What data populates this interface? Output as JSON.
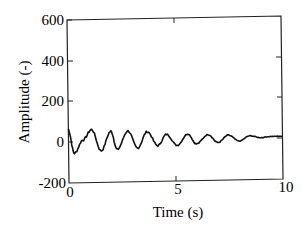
{
  "chart_data": {
    "type": "line",
    "title": "",
    "xlabel": "Time (s)",
    "ylabel": "Amplitude (-)",
    "xlim": [
      0,
      10
    ],
    "ylim": [
      -200,
      600
    ],
    "x_ticks": [
      "0",
      "5",
      "10"
    ],
    "y_ticks": [
      "600",
      "400",
      "200",
      "0",
      "-200"
    ],
    "grid": false,
    "legend": null,
    "series": [
      {
        "name": "signal",
        "description": "Damped oscillation with high-frequency noise, period about 1.1 s, decaying to near zero by 10 s",
        "x": [
          0,
          0.3,
          0.7,
          1.1,
          1.55,
          2.0,
          2.3,
          2.8,
          3.25,
          3.7,
          4.2,
          4.6,
          5.1,
          5.6,
          6.0,
          6.55,
          7.0,
          7.5,
          8.0,
          8.5,
          9.0,
          9.5,
          10
        ],
        "values": [
          65,
          -55,
          10,
          60,
          -45,
          50,
          -40,
          50,
          -35,
          45,
          -25,
          30,
          -25,
          30,
          -20,
          25,
          -15,
          20,
          -10,
          15,
          5,
          10,
          10
        ]
      }
    ]
  }
}
